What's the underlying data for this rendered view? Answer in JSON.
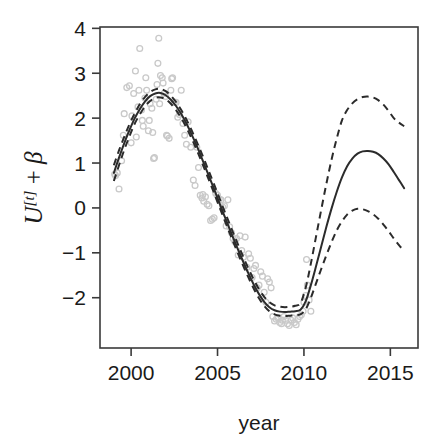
{
  "figure": {
    "background_color": "#ffffff",
    "foreground_color": "#2b2b2b",
    "point_color": "#c9c9c9"
  },
  "chart_data": {
    "type": "line",
    "title": "",
    "subtitle": "",
    "xlabel": "year",
    "ylabel": "U[t] + β",
    "ylabel_parts": {
      "base": "U",
      "superscript": "[t]",
      "operator": " + ",
      "term": "β"
    },
    "xlim": [
      1998.2,
      2016.6
    ],
    "ylim": [
      -3.12,
      4.03
    ],
    "xticks": [
      2000,
      2005,
      2010,
      2015
    ],
    "xticklabels": [
      "2000",
      "2005",
      "2010",
      "2015"
    ],
    "yticks": [
      -2,
      -1,
      0,
      1,
      2,
      3,
      4
    ],
    "yticklabels": [
      "-2",
      "-1",
      "0",
      "1",
      "2",
      "3",
      "4"
    ],
    "grid": false,
    "legend": "none",
    "box": true,
    "annotations": [],
    "series": [
      {
        "name": "fitted smooth",
        "style": "solid",
        "color": "#2b2b2b",
        "x": [
          1999.0,
          1999.3,
          1999.6,
          1999.9,
          2000.2,
          2000.5,
          2000.8,
          2001.1,
          2001.4,
          2001.7,
          2002.0,
          2002.3,
          2002.6,
          2002.9,
          2003.2,
          2003.5,
          2003.8,
          2004.1,
          2004.4,
          2004.7,
          2005.0,
          2005.3,
          2005.6,
          2005.9,
          2006.2,
          2006.5,
          2006.8,
          2007.1,
          2007.4,
          2007.7,
          2008.0,
          2008.3,
          2008.6,
          2008.9,
          2009.2,
          2009.5,
          2009.8,
          2010.1,
          2010.4,
          2010.7,
          2011.0,
          2011.3,
          2011.6,
          2011.9,
          2012.2,
          2012.5,
          2012.8,
          2013.1,
          2013.4,
          2013.7,
          2014.0,
          2014.3,
          2014.6,
          2014.9,
          2015.2,
          2015.5,
          2015.8
        ],
        "values": [
          0.78,
          1.12,
          1.44,
          1.73,
          1.99,
          2.2,
          2.37,
          2.49,
          2.55,
          2.56,
          2.51,
          2.41,
          2.27,
          2.09,
          1.88,
          1.64,
          1.38,
          1.1,
          0.81,
          0.52,
          0.22,
          -0.08,
          -0.37,
          -0.66,
          -0.94,
          -1.21,
          -1.47,
          -1.71,
          -1.92,
          -2.09,
          -2.21,
          -2.28,
          -2.31,
          -2.32,
          -2.31,
          -2.3,
          -2.27,
          -2.08,
          -1.72,
          -1.3,
          -0.86,
          -0.42,
          -0.01,
          0.36,
          0.68,
          0.93,
          1.1,
          1.21,
          1.26,
          1.27,
          1.25,
          1.2,
          1.1,
          0.97,
          0.8,
          0.62,
          0.44
        ]
      },
      {
        "name": "upper confidence band",
        "style": "dashed",
        "color": "#2b2b2b",
        "x": [
          1999.0,
          1999.3,
          1999.6,
          1999.9,
          2000.2,
          2000.5,
          2000.8,
          2001.1,
          2001.4,
          2001.7,
          2002.0,
          2002.3,
          2002.6,
          2002.9,
          2003.2,
          2003.5,
          2003.8,
          2004.1,
          2004.4,
          2004.7,
          2005.0,
          2005.3,
          2005.6,
          2005.9,
          2006.2,
          2006.5,
          2006.8,
          2007.1,
          2007.4,
          2007.7,
          2008.0,
          2008.3,
          2008.6,
          2008.9,
          2009.2,
          2009.5,
          2009.8,
          2010.1,
          2010.4,
          2010.7,
          2011.0,
          2011.3,
          2011.6,
          2011.9,
          2012.2,
          2012.5,
          2012.8,
          2013.1,
          2013.4,
          2013.7,
          2014.0,
          2014.3,
          2014.6,
          2014.9,
          2015.2,
          2015.5,
          2015.8
        ],
        "values": [
          0.95,
          1.28,
          1.58,
          1.86,
          2.1,
          2.31,
          2.47,
          2.58,
          2.64,
          2.65,
          2.6,
          2.5,
          2.36,
          2.18,
          1.97,
          1.73,
          1.47,
          1.2,
          0.91,
          0.62,
          0.33,
          0.03,
          -0.26,
          -0.55,
          -0.83,
          -1.1,
          -1.36,
          -1.6,
          -1.81,
          -1.98,
          -2.1,
          -2.17,
          -2.2,
          -2.21,
          -2.2,
          -2.18,
          -2.12,
          -1.78,
          -1.24,
          -0.64,
          -0.04,
          0.54,
          1.08,
          1.55,
          1.95,
          2.18,
          2.33,
          2.42,
          2.47,
          2.48,
          2.46,
          2.4,
          2.3,
          2.16,
          2.0,
          1.9,
          1.82
        ]
      },
      {
        "name": "lower confidence band",
        "style": "dashed",
        "color": "#2b2b2b",
        "x": [
          1999.0,
          1999.3,
          1999.6,
          1999.9,
          2000.2,
          2000.5,
          2000.8,
          2001.1,
          2001.4,
          2001.7,
          2002.0,
          2002.3,
          2002.6,
          2002.9,
          2003.2,
          2003.5,
          2003.8,
          2004.1,
          2004.4,
          2004.7,
          2005.0,
          2005.3,
          2005.6,
          2005.9,
          2006.2,
          2006.5,
          2006.8,
          2007.1,
          2007.4,
          2007.7,
          2008.0,
          2008.3,
          2008.6,
          2008.9,
          2009.2,
          2009.5,
          2009.8,
          2010.1,
          2010.4,
          2010.7,
          2011.0,
          2011.3,
          2011.6,
          2011.9,
          2012.2,
          2012.5,
          2012.8,
          2013.1,
          2013.4,
          2013.7,
          2014.0,
          2014.3,
          2014.6,
          2014.9,
          2015.2,
          2015.5,
          2015.8
        ],
        "values": [
          0.6,
          0.95,
          1.29,
          1.59,
          1.87,
          2.08,
          2.26,
          2.38,
          2.45,
          2.46,
          2.42,
          2.32,
          2.18,
          2.0,
          1.79,
          1.55,
          1.29,
          1.01,
          0.72,
          0.43,
          0.13,
          -0.17,
          -0.46,
          -0.75,
          -1.03,
          -1.3,
          -1.56,
          -1.8,
          -2.01,
          -2.18,
          -2.3,
          -2.37,
          -2.4,
          -2.41,
          -2.4,
          -2.39,
          -2.37,
          -2.26,
          -2.0,
          -1.68,
          -1.36,
          -1.05,
          -0.76,
          -0.5,
          -0.3,
          -0.15,
          -0.06,
          -0.02,
          -0.03,
          -0.07,
          -0.14,
          -0.24,
          -0.37,
          -0.52,
          -0.68,
          -0.83,
          -0.96
        ]
      }
    ],
    "scatter": {
      "name": "observations",
      "marker": "open-circle",
      "color": "#c9c9c9",
      "points": [
        [
          1999.05,
          0.75
        ],
        [
          1999.1,
          0.72
        ],
        [
          1999.2,
          0.78
        ],
        [
          1999.3,
          0.42
        ],
        [
          1999.45,
          1.05
        ],
        [
          1999.55,
          1.62
        ],
        [
          1999.6,
          2.1
        ],
        [
          1999.75,
          2.68
        ],
        [
          1999.9,
          2.72
        ],
        [
          2000.0,
          1.45
        ],
        [
          2000.05,
          2.05
        ],
        [
          2000.15,
          2.55
        ],
        [
          2000.25,
          3.05
        ],
        [
          2000.3,
          1.58
        ],
        [
          2000.4,
          2.25
        ],
        [
          2000.45,
          2.62
        ],
        [
          2000.5,
          3.55
        ],
        [
          2000.6,
          2.18
        ],
        [
          2000.65,
          1.95
        ],
        [
          2000.7,
          1.82
        ],
        [
          2000.8,
          2.45
        ],
        [
          2000.85,
          2.9
        ],
        [
          2000.9,
          2.62
        ],
        [
          2001.0,
          1.72
        ],
        [
          2001.05,
          1.95
        ],
        [
          2001.1,
          2.32
        ],
        [
          2001.2,
          2.22
        ],
        [
          2001.25,
          1.68
        ],
        [
          2001.3,
          1.1
        ],
        [
          2001.35,
          1.12
        ],
        [
          2001.45,
          2.42
        ],
        [
          2001.5,
          2.75
        ],
        [
          2001.55,
          3.22
        ],
        [
          2001.6,
          3.78
        ],
        [
          2001.65,
          2.32
        ],
        [
          2001.7,
          2.95
        ],
        [
          2001.8,
          2.9
        ],
        [
          2001.85,
          2.78
        ],
        [
          2001.9,
          2.55
        ],
        [
          2002.0,
          2.48
        ],
        [
          2002.05,
          1.62
        ],
        [
          2002.1,
          1.6
        ],
        [
          2002.2,
          1.55
        ],
        [
          2002.3,
          2.62
        ],
        [
          2002.35,
          2.88
        ],
        [
          2002.4,
          2.9
        ],
        [
          2002.5,
          2.35
        ],
        [
          2002.6,
          2.35
        ],
        [
          2002.7,
          2.02
        ],
        [
          2002.8,
          2.08
        ],
        [
          2002.9,
          2.62
        ],
        [
          2003.0,
          1.88
        ],
        [
          2003.1,
          1.62
        ],
        [
          2003.2,
          1.42
        ],
        [
          2003.3,
          1.92
        ],
        [
          2003.45,
          1.35
        ],
        [
          2003.6,
          0.62
        ],
        [
          2003.7,
          0.5
        ],
        [
          2003.8,
          1.35
        ],
        [
          2003.9,
          0.9
        ],
        [
          2004.0,
          0.28
        ],
        [
          2004.1,
          0.22
        ],
        [
          2004.15,
          0.3
        ],
        [
          2004.2,
          0.15
        ],
        [
          2004.3,
          0.25
        ],
        [
          2004.4,
          0.08
        ],
        [
          2004.5,
          0.05
        ],
        [
          2004.6,
          -0.28
        ],
        [
          2004.7,
          -0.25
        ],
        [
          2004.8,
          -0.22
        ],
        [
          2004.9,
          0.32
        ],
        [
          2005.0,
          0.28
        ],
        [
          2005.1,
          0.2
        ],
        [
          2005.2,
          0.18
        ],
        [
          2005.3,
          0.02
        ],
        [
          2005.4,
          0.05
        ],
        [
          2005.5,
          -0.4
        ],
        [
          2005.6,
          0.18
        ],
        [
          2005.7,
          -0.42
        ],
        [
          2005.8,
          -0.55
        ],
        [
          2005.9,
          -0.68
        ],
        [
          2006.0,
          -0.75
        ],
        [
          2006.1,
          -0.68
        ],
        [
          2006.2,
          -1.05
        ],
        [
          2006.3,
          -0.62
        ],
        [
          2006.4,
          -0.95
        ],
        [
          2006.5,
          -1.1
        ],
        [
          2006.6,
          -0.65
        ],
        [
          2006.7,
          -1.32
        ],
        [
          2006.8,
          -1.02
        ],
        [
          2006.9,
          -1.12
        ],
        [
          2007.0,
          -1.55
        ],
        [
          2007.1,
          -1.35
        ],
        [
          2007.2,
          -1.28
        ],
        [
          2007.3,
          -1.78
        ],
        [
          2007.4,
          -1.72
        ],
        [
          2007.5,
          -1.42
        ],
        [
          2007.6,
          -1.52
        ],
        [
          2007.7,
          -1.88
        ],
        [
          2007.8,
          -2.1
        ],
        [
          2007.9,
          -1.58
        ],
        [
          2008.0,
          -1.65
        ],
        [
          2008.1,
          -1.78
        ],
        [
          2008.2,
          -2.42
        ],
        [
          2008.3,
          -2.52
        ],
        [
          2008.4,
          -2.48
        ],
        [
          2008.5,
          -2.45
        ],
        [
          2008.6,
          -2.55
        ],
        [
          2008.7,
          -2.58
        ],
        [
          2008.75,
          -2.5
        ],
        [
          2008.85,
          -2.42
        ],
        [
          2008.95,
          -2.5
        ],
        [
          2009.05,
          -2.58
        ],
        [
          2009.15,
          -2.62
        ],
        [
          2009.25,
          -2.5
        ],
        [
          2009.35,
          -2.45
        ],
        [
          2009.45,
          -2.55
        ],
        [
          2009.55,
          -2.6
        ],
        [
          2009.65,
          -2.48
        ],
        [
          2009.75,
          -2.42
        ],
        [
          2009.85,
          -2.38
        ],
        [
          2009.95,
          -2.3
        ],
        [
          2010.0,
          -2.1
        ],
        [
          2010.1,
          -1.95
        ],
        [
          2010.15,
          -1.15
        ],
        [
          2010.2,
          -1.72
        ],
        [
          2010.3,
          -2.05
        ],
        [
          2010.4,
          -2.3
        ]
      ]
    }
  }
}
